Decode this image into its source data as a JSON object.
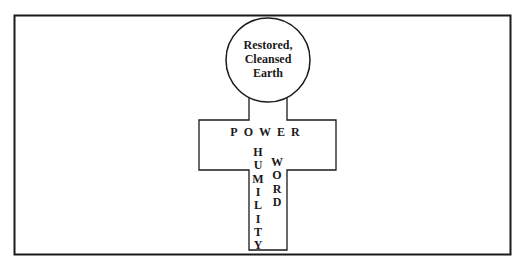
{
  "diagram": {
    "type": "cross-with-circle",
    "circle": {
      "lines": [
        "Restored,",
        "Cleansed",
        "Earth"
      ]
    },
    "crossbar": {
      "label": "POWER"
    },
    "stem": {
      "left_vertical": "HUMILITY",
      "right_vertical": "WORD"
    },
    "colors": {
      "line": "#1a1a1a",
      "background": "#ffffff"
    }
  }
}
